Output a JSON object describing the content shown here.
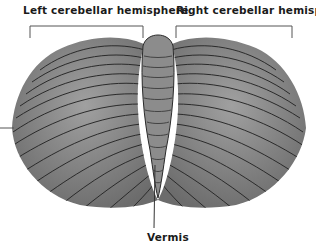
{
  "diagram": {
    "labels": {
      "left_hemisphere": "Left cerebellar hemisphere",
      "right_hemisphere": "Right cerebellar hemisphere",
      "vermis": "Vermis"
    },
    "colors": {
      "tissue": "#7a7a7a",
      "tissue_light": "#9a9a9a",
      "fold_lines": "#2a2a2a",
      "leader_lines": "#555555",
      "text": "#1a1a1a"
    }
  }
}
